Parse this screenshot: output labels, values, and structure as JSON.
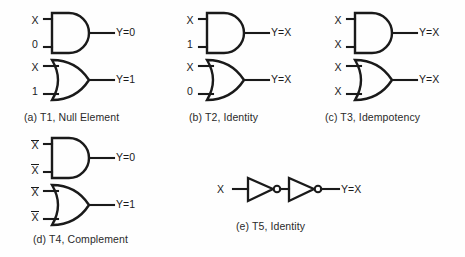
{
  "figure": {
    "title_visible": false,
    "background_color": "#fefefe",
    "stroke_color": "#1a1a1a",
    "text_color": "#1a1a1a"
  },
  "groups": [
    {
      "id": "a",
      "caption": "(a) T1, Null Element",
      "gates": [
        {
          "type": "and",
          "icon": "and-gate-icon",
          "inputs": [
            {
              "label": "X",
              "overbar": false
            },
            {
              "label": "0",
              "overbar": false
            }
          ],
          "output": {
            "label": "Y=0"
          }
        },
        {
          "type": "or",
          "icon": "or-gate-icon",
          "inputs": [
            {
              "label": "X",
              "overbar": false
            },
            {
              "label": "1",
              "overbar": false
            }
          ],
          "output": {
            "label": "Y=1"
          }
        }
      ]
    },
    {
      "id": "b",
      "caption": "(b) T2, Identity",
      "gates": [
        {
          "type": "and",
          "icon": "and-gate-icon",
          "inputs": [
            {
              "label": "X",
              "overbar": false
            },
            {
              "label": "1",
              "overbar": false
            }
          ],
          "output": {
            "label": "Y=X"
          }
        },
        {
          "type": "or",
          "icon": "or-gate-icon",
          "inputs": [
            {
              "label": "X",
              "overbar": false
            },
            {
              "label": "0",
              "overbar": false
            }
          ],
          "output": {
            "label": "Y=X"
          }
        }
      ]
    },
    {
      "id": "c",
      "caption": "(c) T3, Idempotency",
      "gates": [
        {
          "type": "and",
          "icon": "and-gate-icon",
          "inputs": [
            {
              "label": "X",
              "overbar": false
            },
            {
              "label": "X",
              "overbar": false
            }
          ],
          "output": {
            "label": "Y=X"
          }
        },
        {
          "type": "or",
          "icon": "or-gate-icon",
          "inputs": [
            {
              "label": "X",
              "overbar": false
            },
            {
              "label": "X",
              "overbar": false
            }
          ],
          "output": {
            "label": "Y=X"
          }
        }
      ]
    },
    {
      "id": "d",
      "caption": "(d) T4, Complement",
      "gates": [
        {
          "type": "and",
          "icon": "and-gate-icon",
          "inputs": [
            {
              "label": "X",
              "overbar": false
            },
            {
              "label": "X",
              "overbar": true
            }
          ],
          "output": {
            "label": "Y=0"
          }
        },
        {
          "type": "or",
          "icon": "or-gate-icon",
          "inputs": [
            {
              "label": "X",
              "overbar": false
            },
            {
              "label": "X",
              "overbar": true
            }
          ],
          "output": {
            "label": "Y=1"
          }
        }
      ]
    },
    {
      "id": "e",
      "caption": "(e) T5, Identity",
      "gates": [
        {
          "type": "not-chain",
          "icon": "not-gate-icon",
          "stages": 2,
          "inputs": [
            {
              "label": "X",
              "overbar": false
            }
          ],
          "output": {
            "label": "Y=X"
          }
        }
      ]
    }
  ]
}
